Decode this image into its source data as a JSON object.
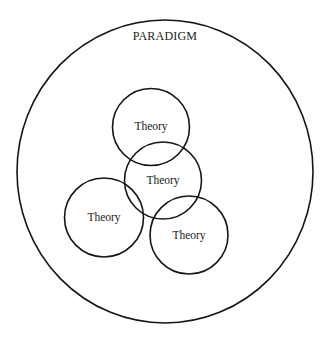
{
  "diagram": {
    "type": "nested-venn",
    "background": "#ffffff",
    "stroke_color": "#151515",
    "paradigm": {
      "label": "PARADIGM",
      "shape": {
        "cx": 165,
        "cy": 171.5,
        "rx": 148,
        "ry": 151.5
      },
      "label_pos": {
        "x": 165,
        "y": 40
      }
    },
    "theories": [
      {
        "label": "Theory",
        "shape": {
          "cx": 151,
          "cy": 127,
          "r": 38.5
        },
        "label_pos": {
          "x": 151,
          "y": 130
        }
      },
      {
        "label": "Theory",
        "shape": {
          "cx": 163,
          "cy": 180.5,
          "r": 38.5
        },
        "label_pos": {
          "x": 163,
          "y": 184
        }
      },
      {
        "label": "Theory",
        "shape": {
          "cx": 104,
          "cy": 217.5,
          "r": 39.5
        },
        "label_pos": {
          "x": 104,
          "y": 221
        }
      },
      {
        "label": "Theory",
        "shape": {
          "cx": 189,
          "cy": 235,
          "r": 39
        },
        "label_pos": {
          "x": 189,
          "y": 239
        }
      }
    ]
  }
}
